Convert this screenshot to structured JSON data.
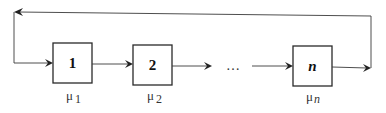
{
  "diagram": {
    "type": "cyclic queueing network (tandem stations with feedback loop)",
    "stations": [
      {
        "label": "1",
        "rate_symbol": "μ",
        "rate_subscript": "1"
      },
      {
        "label": "2",
        "rate_symbol": "μ",
        "rate_subscript": "2"
      },
      {
        "label": "n",
        "rate_symbol": "μ",
        "rate_subscript": "n"
      }
    ],
    "ellipsis": "…",
    "feedback": "output of station n returns to input of station 1",
    "colors": {
      "stroke": "#2a2a2a",
      "background": "#ffffff"
    }
  }
}
